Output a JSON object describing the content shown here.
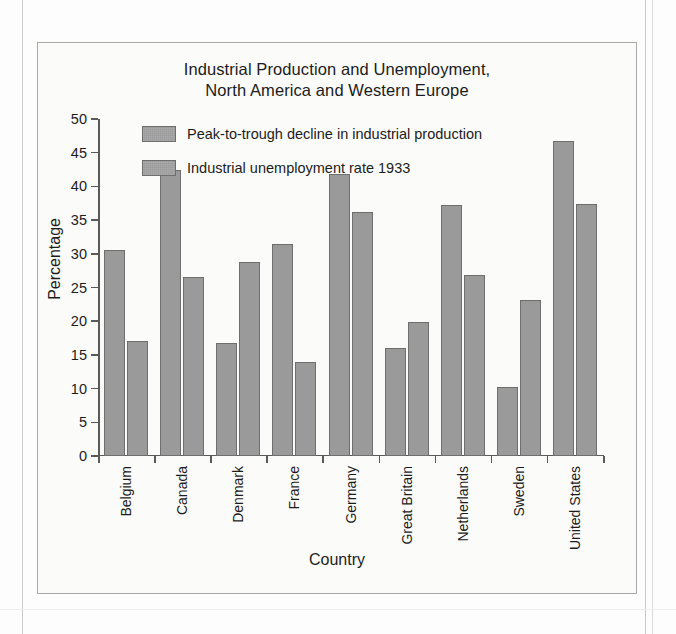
{
  "chart_data": {
    "type": "bar",
    "title": "Industrial Production and Unemployment, North America and Western Europe",
    "title_lines": [
      "Industrial Production and Unemployment,",
      "North America and Western Europe"
    ],
    "xlabel": "Country",
    "ylabel": "Percentage",
    "ylim": [
      0,
      50
    ],
    "yticks": [
      50,
      45,
      40,
      35,
      30,
      25,
      20,
      15,
      10,
      5,
      0
    ],
    "grid": false,
    "legend_position": "top-left inside plot",
    "categories": [
      "Belgium",
      "Canada",
      "Denmark",
      "France",
      "Germany",
      "Great Britain",
      "Netherlands",
      "Sweden",
      "United States"
    ],
    "series": [
      {
        "name": "Peak-to-trough decline in industrial production",
        "color": "#9a9a9a",
        "values": [
          30.6,
          42.5,
          16.8,
          31.4,
          41.8,
          16.1,
          37.3,
          10.2,
          46.8
        ]
      },
      {
        "name": "Industrial unemployment rate 1933",
        "color": "#9a9a9a",
        "values": [
          17.0,
          26.6,
          28.8,
          14.0,
          36.2,
          19.9,
          26.9,
          23.1,
          37.4
        ]
      }
    ]
  },
  "colors": {
    "bar_fill": "#9a9a9a",
    "bar_stroke": "#6e6e6e",
    "axis": "#5a5a5a",
    "text": "#1c1c1c",
    "box_border": "#a8a8a8",
    "plot_background": "#fbfbfa"
  }
}
